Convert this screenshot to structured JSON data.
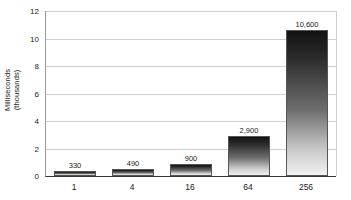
{
  "chart_data": {
    "type": "bar",
    "title": "",
    "xlabel": "",
    "ylabel": "Milliseconds (thousands)",
    "ylabel_lines": [
      "Milliseconds",
      "(thousands)"
    ],
    "categories": [
      "1",
      "4",
      "16",
      "64",
      "256"
    ],
    "values": [
      0.33,
      0.49,
      0.9,
      2.9,
      10.6
    ],
    "data_labels": [
      "330",
      "490",
      "900",
      "2,900",
      "10,600"
    ],
    "ylim": [
      0,
      12
    ],
    "yticks": [
      0,
      2,
      4,
      6,
      8,
      10,
      12
    ],
    "ytick_labels": [
      "0",
      "2",
      "4",
      "6",
      "8",
      "10",
      "12"
    ],
    "grid": true,
    "legend": "none",
    "units_note": "values plotted in thousands of milliseconds",
    "colors": {
      "bar_top": "#121212",
      "bar_bottom": "#f2f2f2",
      "gridline": "#d0d0d0",
      "axis": "#3a3a3a",
      "text": "#1a1a1a",
      "background": "#ffffff"
    }
  }
}
